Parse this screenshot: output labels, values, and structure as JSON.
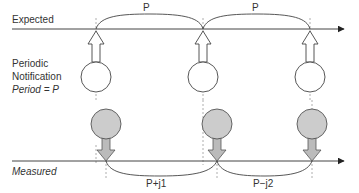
{
  "labels": {
    "expected": "Expected",
    "measured": "Measured",
    "notification_line1": "Periodic",
    "notification_line2": "Notification",
    "period": "Period = P",
    "period_top_1": "P",
    "period_top_2": "P",
    "period_bottom_1": "P+j1",
    "period_bottom_2": "P−j2"
  },
  "colors": {
    "line": "#444444",
    "dashed": "#999999",
    "filled_circle": "#cccccc",
    "arrow_fill": "#bbbbbb",
    "text": "#333333"
  }
}
